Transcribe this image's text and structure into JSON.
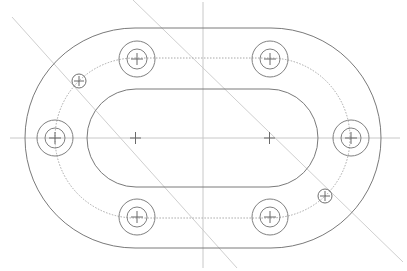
{
  "drawing": {
    "title": "Obround flange plate with bolt holes",
    "colors": {
      "outline": "#7a7a7a",
      "centerline": "#c8c8c8",
      "pitch": "#a8a8a8",
      "background": "#ffffff"
    },
    "features": {
      "outer_slot": "outer-profile",
      "inner_slot": "inner-cutout",
      "pitch_slot": "bolt-pitch-line",
      "large_hole_count": 6,
      "small_hole_count": 2,
      "arc_centers": 2
    }
  }
}
